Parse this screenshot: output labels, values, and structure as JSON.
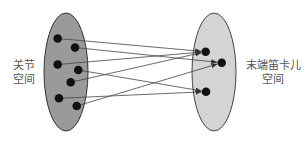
{
  "diagram": {
    "type": "mapping",
    "left_set": {
      "label_line1": "关节",
      "label_line2": "空间",
      "fill": "#9a9a9a",
      "ellipse": {
        "cx": 66,
        "cy": 72,
        "rx": 22,
        "ry": 59
      },
      "points": [
        {
          "x": 57.7,
          "y": 38.5
        },
        {
          "x": 75,
          "y": 47.5
        },
        {
          "x": 57.7,
          "y": 64.5
        },
        {
          "x": 78.3,
          "y": 70
        },
        {
          "x": 70.7,
          "y": 82.3
        },
        {
          "x": 59,
          "y": 98.3
        },
        {
          "x": 76.7,
          "y": 106
        }
      ]
    },
    "right_set": {
      "label_line1": "末端笛卡儿",
      "label_line2": "空间",
      "fill": "#d4d4d4",
      "ellipse": {
        "cx": 214,
        "cy": 72,
        "rx": 22,
        "ry": 59
      },
      "points": [
        {
          "x": 205.7,
          "y": 51.7
        },
        {
          "x": 221.7,
          "y": 62.7
        },
        {
          "x": 206,
          "y": 91.7
        }
      ]
    },
    "mappings": [
      {
        "from": 0,
        "to": 0
      },
      {
        "from": 1,
        "to": 1
      },
      {
        "from": 2,
        "to": 0
      },
      {
        "from": 3,
        "to": 2
      },
      {
        "from": 4,
        "to": 0
      },
      {
        "from": 5,
        "to": 2
      },
      {
        "from": 6,
        "to": 1
      }
    ],
    "point_color": "#111111",
    "line_color": "#444444"
  }
}
